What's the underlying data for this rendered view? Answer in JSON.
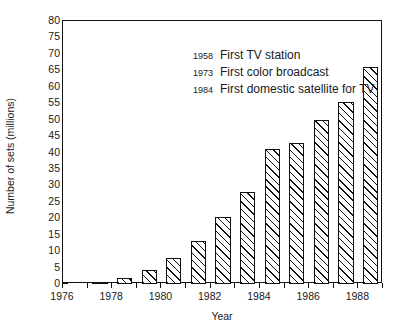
{
  "chart_data": {
    "type": "bar",
    "title": "",
    "xlabel": "Year",
    "ylabel": "Number of sets (millions)",
    "categories": [
      1977,
      1978,
      1979,
      1980,
      1981,
      1982,
      1983,
      1984,
      1985,
      1986,
      1987,
      1988
    ],
    "values": [
      0.7,
      1.8,
      4.3,
      8.0,
      13.0,
      20.5,
      28.0,
      41.0,
      43.0,
      50.0,
      55.5,
      66.0
    ],
    "xlim": [
      1976,
      1989
    ],
    "ylim": [
      0,
      80
    ],
    "ytick_values": [
      0,
      5,
      10,
      15,
      20,
      25,
      30,
      35,
      40,
      45,
      50,
      55,
      60,
      65,
      70,
      75,
      80
    ],
    "ytick_labels": [
      "0",
      "5",
      "10",
      "15",
      "20",
      "25",
      "30",
      "35",
      "40",
      "45",
      "50",
      "55",
      "60",
      "65",
      "70",
      "75",
      "80"
    ],
    "xtick_values": [
      1976,
      1977,
      1978,
      1979,
      1980,
      1981,
      1982,
      1983,
      1984,
      1985,
      1986,
      1987,
      1988,
      1989
    ],
    "xtick_labeled": [
      {
        "value": 1976,
        "label": "1976"
      },
      {
        "value": 1978,
        "label": "1978"
      },
      {
        "value": 1980,
        "label": "1980"
      },
      {
        "value": 1982,
        "label": "1982"
      },
      {
        "value": 1984,
        "label": "1984"
      },
      {
        "value": 1986,
        "label": "1986"
      },
      {
        "value": 1988,
        "label": "1988"
      }
    ],
    "grid": false,
    "legend": "none",
    "bar_style": {
      "fill": "#ffffff",
      "edge_color": "#111111",
      "hatch": "diagonal-up"
    },
    "annotations": [
      {
        "year": "1958",
        "text": "First TV station"
      },
      {
        "year": "1973",
        "text": "First color broadcast"
      },
      {
        "year": "1984",
        "text": "First domestic satellite for TV"
      }
    ]
  }
}
